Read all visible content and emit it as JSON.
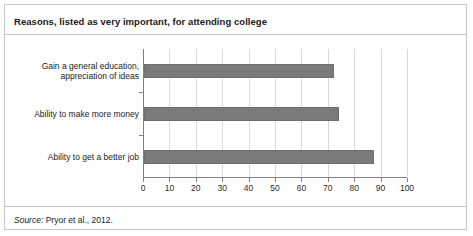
{
  "figure": {
    "title": "Reasons, listed as very important, for attending college",
    "source_label": "Source:",
    "source_text": " Pryor et al., 2012.",
    "bar_color": "#7a7a7a",
    "grid_color": "#d8d8d8",
    "axis_color": "#808080",
    "border_color": "#c8c8c8"
  },
  "chart_data": {
    "type": "bar",
    "orientation": "horizontal",
    "title": "Reasons, listed as very important, for attending college",
    "xlabel": "",
    "ylabel": "",
    "xlim": [
      0,
      100
    ],
    "grid": true,
    "legend": "none",
    "categories": [
      "Gain a general education,\nappreciation of ideas",
      "Ability to make more money",
      "Ability to get a better job"
    ],
    "values": [
      72,
      74,
      87
    ],
    "xticks": [
      0,
      10,
      20,
      30,
      40,
      50,
      60,
      70,
      80,
      90,
      100
    ],
    "xticklabels": [
      "0",
      "10",
      "20",
      "30",
      "40",
      "50",
      "60",
      "70",
      "80",
      "90",
      "100"
    ]
  }
}
